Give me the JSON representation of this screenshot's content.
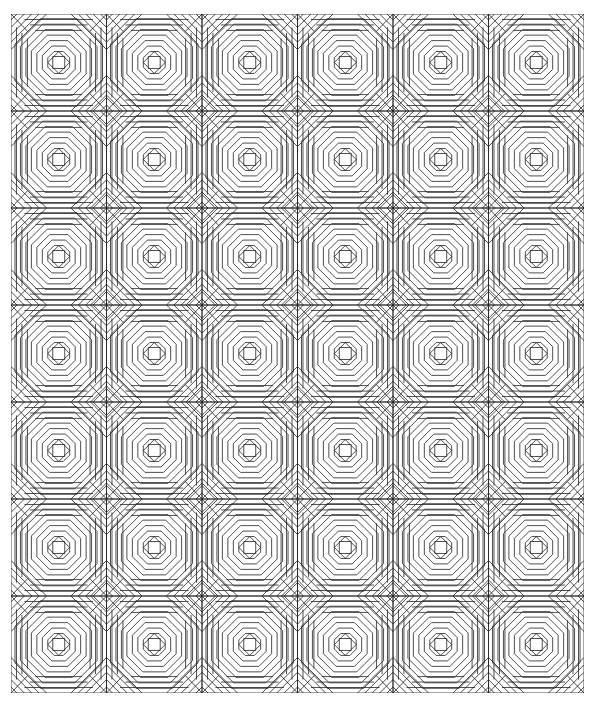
{
  "quilt": {
    "pattern": "pineapple",
    "columns": 6,
    "rows": 7,
    "line_color": "#222222",
    "background": "#ffffff"
  }
}
